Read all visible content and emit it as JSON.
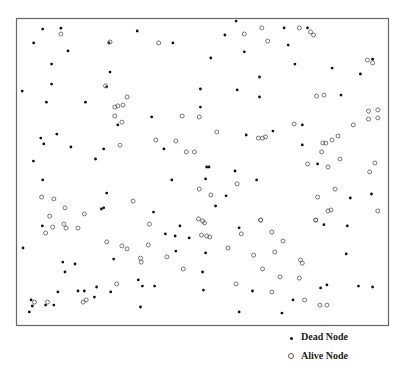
{
  "chart_data": {
    "type": "scatter",
    "title": "",
    "xlabel": "",
    "ylabel": "",
    "grid": false,
    "xlim": [
      0,
      100
    ],
    "ylim": [
      0,
      100
    ],
    "legend_position": "bottom-right",
    "series": [
      {
        "name": "Dead Node",
        "marker": "filled-dot",
        "color": "#111111",
        "points": [
          [
            6.9,
            96.7
          ],
          [
            11.8,
            97.0
          ],
          [
            4.5,
            92.2
          ],
          [
            13.7,
            89.6
          ],
          [
            9.3,
            85.3
          ],
          [
            9.3,
            78.8
          ],
          [
            1.4,
            76.5
          ],
          [
            7.9,
            72.9
          ],
          [
            18.4,
            72.9
          ],
          [
            24.7,
            92.2
          ],
          [
            25.0,
            82.7
          ],
          [
            24.1,
            77.9
          ],
          [
            32.3,
            96.1
          ],
          [
            41.9,
            92.2
          ],
          [
            49.3,
            71.3
          ],
          [
            49.3,
            77.2
          ],
          [
            58.9,
            99.3
          ],
          [
            55.9,
            94.8
          ],
          [
            71.8,
            97.1
          ],
          [
            78.1,
            97.1
          ],
          [
            72.9,
            91.5
          ],
          [
            52.1,
            87.3
          ],
          [
            61.1,
            89.3
          ],
          [
            74.7,
            85.3
          ],
          [
            84.7,
            84.0
          ],
          [
            95.6,
            86.9
          ],
          [
            92.3,
            82.1
          ],
          [
            65.2,
            81.1
          ],
          [
            59.2,
            76.9
          ],
          [
            65.2,
            74.6
          ],
          [
            87.1,
            75.2
          ],
          [
            6.4,
            61.2
          ],
          [
            7.2,
            59.3
          ],
          [
            10.7,
            62.5
          ],
          [
            14.5,
            58.3
          ],
          [
            23.3,
            57.7
          ],
          [
            4.4,
            53.7
          ],
          [
            21.1,
            54.4
          ],
          [
            6.9,
            47.6
          ],
          [
            36.2,
            68.1
          ],
          [
            27.1,
            65.5
          ],
          [
            39.5,
            57.7
          ],
          [
            36.7,
            37.1
          ],
          [
            24.1,
            43.3
          ],
          [
            23.3,
            38.5
          ],
          [
            22.7,
            38.1
          ],
          [
            50.7,
            47.9
          ],
          [
            41.6,
            47.6
          ],
          [
            51.0,
            51.8
          ],
          [
            61.6,
            62.2
          ],
          [
            68.8,
            63.5
          ],
          [
            76.7,
            65.5
          ],
          [
            76.7,
            59.0
          ],
          [
            80.8,
            52.8
          ],
          [
            51.6,
            51.8
          ],
          [
            58.6,
            50.5
          ],
          [
            64.4,
            47.6
          ],
          [
            56.2,
            42.4
          ],
          [
            53.4,
            39.1
          ],
          [
            89.6,
            41.7
          ],
          [
            95.3,
            43.0
          ],
          [
            6.8,
            32.6
          ],
          [
            1.6,
            25.4
          ],
          [
            12.3,
            20.8
          ],
          [
            15.6,
            20.2
          ],
          [
            12.9,
            17.6
          ],
          [
            26.0,
            21.8
          ],
          [
            25.2,
            11.1
          ],
          [
            18.1,
            11.4
          ],
          [
            16.4,
            11.4
          ],
          [
            11.0,
            11.1
          ],
          [
            3.8,
            8.5
          ],
          [
            4.1,
            6.5
          ],
          [
            9.9,
            6.8
          ],
          [
            3.3,
            4.6
          ],
          [
            7.7,
            6.8
          ],
          [
            20.8,
            9.4
          ],
          [
            21.4,
            12.7
          ],
          [
            32.6,
            15.0
          ],
          [
            33.7,
            13.0
          ],
          [
            39.9,
            30.0
          ],
          [
            42.5,
            29.3
          ],
          [
            42.7,
            24.4
          ],
          [
            37.0,
            13.0
          ],
          [
            33.2,
            6.2
          ],
          [
            49.9,
            17.6
          ],
          [
            50.1,
            11.7
          ],
          [
            43.8,
            32.6
          ],
          [
            46.3,
            28.7
          ],
          [
            59.7,
            32.0
          ],
          [
            82.5,
            33.0
          ],
          [
            88.8,
            32.6
          ],
          [
            88.5,
            23.5
          ],
          [
            50.7,
            23.8
          ],
          [
            63.3,
            11.4
          ],
          [
            74.2,
            8.5
          ],
          [
            81.6,
            12.4
          ],
          [
            83.3,
            13.4
          ],
          [
            91.8,
            13.0
          ],
          [
            95.6,
            12.7
          ],
          [
            59.7,
            4.6
          ],
          [
            71.2,
            4.2
          ]
        ]
      },
      {
        "name": "Alive Node",
        "marker": "hollow-circle",
        "color": "#555555",
        "points": [
          [
            11.8,
            95.1
          ],
          [
            25.0,
            92.5
          ],
          [
            38.1,
            92.2
          ],
          [
            23.8,
            78.2
          ],
          [
            29.6,
            74.6
          ],
          [
            27.1,
            71.7
          ],
          [
            26.3,
            71.3
          ],
          [
            28.5,
            72.0
          ],
          [
            65.8,
            97.1
          ],
          [
            75.9,
            97.1
          ],
          [
            61.1,
            95.1
          ],
          [
            78.9,
            95.8
          ],
          [
            79.7,
            94.8
          ],
          [
            67.4,
            92.8
          ],
          [
            94.2,
            86.6
          ],
          [
            95.6,
            85.7
          ],
          [
            80.5,
            74.9
          ],
          [
            82.5,
            75.2
          ],
          [
            94.5,
            70.0
          ],
          [
            97.0,
            70.4
          ],
          [
            26.3,
            68.4
          ],
          [
            28.2,
            66.4
          ],
          [
            27.7,
            58.9
          ],
          [
            37.3,
            60.6
          ],
          [
            44.4,
            68.4
          ],
          [
            49.0,
            68.1
          ],
          [
            45.5,
            56.7
          ],
          [
            47.7,
            56.7
          ],
          [
            42.7,
            60.3
          ],
          [
            6.6,
            42.0
          ],
          [
            9.9,
            41.4
          ],
          [
            12.9,
            38.5
          ],
          [
            8.8,
            35.8
          ],
          [
            18.1,
            36.5
          ],
          [
            31.2,
            40.7
          ],
          [
            49.0,
            44.6
          ],
          [
            52.1,
            42.7
          ],
          [
            48.8,
            34.9
          ],
          [
            53.7,
            63.2
          ],
          [
            74.5,
            65.8
          ],
          [
            64.9,
            61.2
          ],
          [
            66.0,
            61.2
          ],
          [
            66.8,
            61.6
          ],
          [
            82.2,
            59.6
          ],
          [
            83.0,
            59.6
          ],
          [
            84.7,
            60.6
          ],
          [
            86.3,
            61.9
          ],
          [
            90.4,
            65.5
          ],
          [
            94.5,
            67.4
          ],
          [
            97.0,
            67.8
          ],
          [
            81.9,
            56.7
          ],
          [
            78.1,
            52.8
          ],
          [
            83.6,
            51.8
          ],
          [
            86.8,
            54.4
          ],
          [
            96.2,
            53.1
          ],
          [
            94.8,
            50.2
          ],
          [
            85.5,
            44.6
          ],
          [
            59.2,
            46.3
          ],
          [
            80.8,
            42.0
          ],
          [
            84.4,
            37.8
          ],
          [
            83.6,
            37.5
          ],
          [
            97.0,
            37.5
          ],
          [
            65.5,
            34.5
          ],
          [
            80.3,
            34.5
          ],
          [
            9.6,
            32.2
          ],
          [
            12.6,
            33.2
          ],
          [
            13.2,
            31.9
          ],
          [
            16.4,
            31.9
          ],
          [
            7.7,
            30.3
          ],
          [
            24.1,
            27.4
          ],
          [
            28.2,
            26.1
          ],
          [
            29.6,
            25.1
          ],
          [
            35.6,
            33.2
          ],
          [
            35.3,
            26.4
          ],
          [
            33.2,
            22.1
          ],
          [
            33.4,
            20.8
          ],
          [
            40.3,
            22.5
          ],
          [
            44.7,
            18.6
          ],
          [
            26.8,
            13.7
          ],
          [
            18.6,
            8.5
          ],
          [
            8.2,
            7.8
          ],
          [
            17.8,
            7.8
          ],
          [
            4.7,
            7.8
          ],
          [
            49.6,
            29.6
          ],
          [
            49.9,
            34.2
          ],
          [
            50.4,
            33.6
          ],
          [
            51.8,
            29.0
          ],
          [
            65.5,
            34.5
          ],
          [
            80.3,
            34.5
          ],
          [
            51.0,
            29.3
          ],
          [
            60.3,
            30.0
          ],
          [
            68.5,
            30.6
          ],
          [
            71.5,
            27.7
          ],
          [
            56.7,
            25.4
          ],
          [
            63.6,
            23.1
          ],
          [
            69.3,
            24.1
          ],
          [
            76.2,
            21.5
          ],
          [
            76.7,
            20.5
          ],
          [
            66.0,
            18.6
          ],
          [
            70.7,
            16.0
          ],
          [
            75.9,
            15.6
          ],
          [
            58.9,
            13.7
          ],
          [
            68.5,
            11.1
          ],
          [
            77.3,
            8.5
          ],
          [
            81.4,
            6.8
          ],
          [
            83.3,
            6.8
          ]
        ]
      }
    ]
  },
  "legend": {
    "dead_label": "Dead Node",
    "alive_label": "Alive Node"
  }
}
